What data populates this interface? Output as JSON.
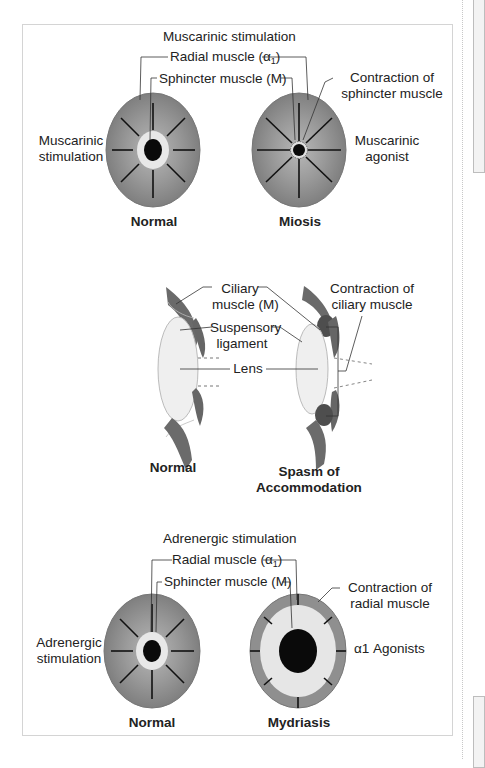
{
  "figure": {
    "panel_top": {
      "title": "Muscarinic stimulation",
      "radial_label": "Radial muscle (α",
      "radial_sub": "1",
      "radial_close": ")",
      "sphincter_label": "Sphincter muscle (M)",
      "left_side_label_line1": "Muscarinic",
      "left_side_label_line2": "stimulation",
      "right_callout_line1": "Contraction of",
      "right_callout_line2": "sphincter muscle",
      "right_side_label_line1": "Muscarinic",
      "right_side_label_line2": "agonist",
      "left_eye_caption": "Normal",
      "right_eye_caption": "Miosis"
    },
    "panel_middle": {
      "ciliary_label_line1": "Ciliary",
      "ciliary_label_line2": "muscle (M)",
      "suspensory_label_line1": "Suspensory",
      "suspensory_label_line2": "ligament",
      "lens_label": "Lens",
      "right_callout_line1": "Contraction of",
      "right_callout_line2": "ciliary muscle",
      "left_caption": "Normal",
      "right_caption_line1": "Spasm of",
      "right_caption_line2": "Accommodation"
    },
    "panel_bottom": {
      "title": "Adrenergic stimulation",
      "radial_label": "Radial muscle (α",
      "radial_sub": "1",
      "radial_close": ")",
      "sphincter_label": "Sphincter muscle (M)",
      "left_side_label_line1": "Adrenergic",
      "left_side_label_line2": "stimulation",
      "right_callout_line1": "Contraction of",
      "right_callout_line2": "radial muscle",
      "right_side_label": "α1 Agonists",
      "left_eye_caption": "Normal",
      "right_eye_caption": "Mydriasis"
    },
    "colors": {
      "iris": "#8c8c8c",
      "iris_light": "#a9a9a9",
      "sphincter": "#e6e6e6",
      "pupil": "#0a0a0a",
      "muscle_dark": "#5a5a5a",
      "lens": "#ececec",
      "frame_border": "#d4d4d4"
    }
  }
}
